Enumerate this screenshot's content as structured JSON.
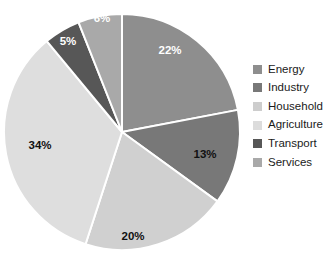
{
  "chart_data": {
    "type": "pie",
    "title": "",
    "xlabel": "",
    "ylabel": "",
    "unit": "%",
    "legend_position": "right",
    "grid": false,
    "start_angle_deg": 0,
    "direction": "clockwise",
    "categories": [
      "Energy",
      "Industry",
      "Household",
      "Agriculture",
      "Transport",
      "Services"
    ],
    "values": [
      22,
      13,
      20,
      34,
      5,
      6
    ],
    "data_labels": [
      "22%",
      "13%",
      "20%",
      "34%",
      "5%",
      "6%"
    ],
    "colors": [
      "#8e8e8e",
      "#787878",
      "#d0d0d0",
      "#dedede",
      "#575757",
      "#a9a9a9"
    ],
    "slice_label_colors": [
      "#ffffff",
      "#111111",
      "#111111",
      "#111111",
      "#ffffff",
      "#ffffff"
    ],
    "separator_color": "#ffffff",
    "slices": [
      {
        "name": "Energy",
        "value": 22,
        "label": "22%",
        "color": "#8e8e8e",
        "label_color": "#ffffff",
        "label_x": 170,
        "label_y": 51
      },
      {
        "name": "Industry",
        "value": 13,
        "label": "13%",
        "color": "#787878",
        "label_color": "#111111",
        "label_x": 205,
        "label_y": 155
      },
      {
        "name": "Household",
        "value": 20,
        "label": "20%",
        "color": "#d0d0d0",
        "label_color": "#111111",
        "label_x": 133,
        "label_y": 237
      },
      {
        "name": "Agriculture",
        "value": 34,
        "label": "34%",
        "color": "#dedede",
        "label_color": "#111111",
        "label_x": 40,
        "label_y": 146
      },
      {
        "name": "Transport",
        "value": 5,
        "label": "5%",
        "color": "#575757",
        "label_color": "#ffffff",
        "label_x": 68,
        "label_y": 42
      },
      {
        "name": "Services",
        "value": 6,
        "label": "6%",
        "color": "#a9a9a9",
        "label_color": "#ffffff",
        "label_x": 102,
        "label_y": 19
      }
    ]
  },
  "legend": {
    "items": [
      {
        "label": "Energy",
        "color": "#8e8e8e"
      },
      {
        "label": "Industry",
        "color": "#787878"
      },
      {
        "label": "Household",
        "color": "#cdcdcd"
      },
      {
        "label": "Agriculture",
        "color": "#dcdcdc"
      },
      {
        "label": "Transport",
        "color": "#575757"
      },
      {
        "label": "Services",
        "color": "#a9a9a9"
      }
    ]
  },
  "geometry": {
    "center_x": 122,
    "center_y": 132,
    "radius": 118
  }
}
